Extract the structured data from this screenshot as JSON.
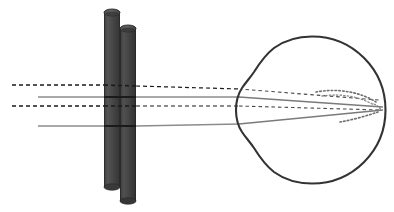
{
  "figure": {
    "kind": "optics-ray-diagram",
    "title": "",
    "caption": "",
    "canvas": {
      "width": 394,
      "height": 212,
      "background": "#ffffff"
    }
  },
  "colors": {
    "rod_body": "#4a4a4a",
    "rod_body_dark": "#3d3d3d",
    "rod_top": "#5c5c5c",
    "rod_outline": "#2e2e2e",
    "eye_outline": "#333333",
    "ray_solid": "#8c8c8c",
    "ray_dashed": "#1a1a1a",
    "ray_dotted_focus": "#6e6e6e",
    "ray_over_rod": "#1a1a1a"
  },
  "eye": {
    "label": "eye globe",
    "center_x": 312,
    "center_y": 110,
    "radius": 73,
    "stroke_width": 2.1,
    "cornea": {
      "label": "cornea bulge",
      "apex_x": 236,
      "top_y": 70,
      "bottom_y": 152
    },
    "retina_label": "retina"
  },
  "rods": [
    {
      "name": "rod-left",
      "x": 104,
      "width": 16,
      "top_y": 12,
      "bottom_y": 187,
      "ellipse_ry": 3.5
    },
    {
      "name": "rod-right",
      "x": 120,
      "width": 16,
      "top_y": 28,
      "bottom_y": 201,
      "ellipse_ry": 3.5
    }
  ],
  "rays": [
    {
      "name": "ray-dashed-upper",
      "style": "dashed",
      "color": "#1a1a1a",
      "entry_y": 85,
      "at_cornea_y": 88,
      "focus_x": 379,
      "focus_y": 100,
      "dash": "4,3"
    },
    {
      "name": "ray-solid-upper",
      "style": "solid",
      "color": "#8c8c8c",
      "entry_y": 97,
      "at_cornea_y": 97,
      "focus_x": 383,
      "focus_y": 107,
      "dash": "none"
    },
    {
      "name": "ray-dashed-lower",
      "style": "dashed",
      "color": "#1a1a1a",
      "entry_y": 106,
      "at_cornea_y": 106,
      "focus_x": 380,
      "focus_y": 110,
      "dash": "4,3"
    },
    {
      "name": "ray-solid-lower",
      "style": "solid",
      "color": "#8c8c8c",
      "entry_y": 126,
      "at_cornea_y": 125,
      "focus_x": 383,
      "focus_y": 110,
      "dash": "none"
    }
  ],
  "focus_arcs": [
    {
      "name": "focus-arc-upper",
      "style": "dotted",
      "color": "#6e6e6e",
      "description": "dotted blur arc above focal point on retina"
    },
    {
      "name": "focus-arc-lower",
      "style": "dotted",
      "color": "#6e6e6e",
      "description": "dotted blur arc below focal point on retina"
    }
  ],
  "ray_origin_x": 12,
  "rod_entry_x": 104,
  "rod_exit_x": 136
}
